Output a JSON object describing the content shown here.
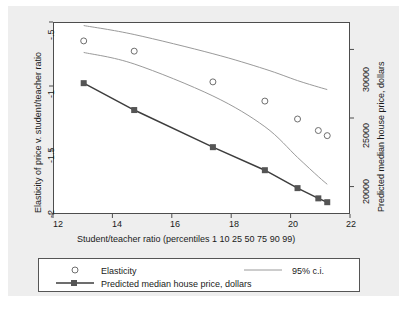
{
  "chart_data": {
    "type": "line",
    "title": "",
    "xlabel": "Student/teacher ratio (percentiles 1 10 25 50 75 90 99)",
    "ylabel": "Elasticity of price v. student/teacher ratio",
    "ylabel_right": "Predicted median house price, dollars",
    "xlim": [
      12,
      22
    ],
    "ylim": [
      -2.0,
      -0.5
    ],
    "ylim_right": [
      18000,
      32000
    ],
    "xticks": [
      "12",
      "14",
      "16",
      "18",
      "20",
      "22"
    ],
    "xtick_values": [
      12,
      14,
      16,
      18,
      20,
      22
    ],
    "yticks": [
      "-.5",
      "-1",
      "-1.5",
      "-2"
    ],
    "ytick_values": [
      -0.5,
      -1,
      -1.5,
      -2
    ],
    "yticks_right": [
      "20000",
      "25000",
      "30000"
    ],
    "ytick_right_values": [
      20000,
      25000,
      30000
    ],
    "grid": false,
    "legend_position": "bottom",
    "x": [
      13.0,
      14.7,
      17.35,
      19.1,
      20.2,
      20.9,
      21.2
    ],
    "series": [
      {
        "name": "Elasticity",
        "marker": "open-circle",
        "color": "#6e6e6e",
        "values": [
          -0.64,
          -0.72,
          -0.96,
          -1.11,
          -1.25,
          -1.34,
          -1.38
        ]
      },
      {
        "name": "95% c.i. upper",
        "marker": "none",
        "color": "#9a9a9a",
        "values": [
          -0.52,
          -0.59,
          -0.74,
          -0.86,
          -0.95,
          -1.0,
          -1.02
        ]
      },
      {
        "name": "95% c.i. lower",
        "marker": "none",
        "color": "#9a9a9a",
        "values": [
          -0.73,
          -0.82,
          -1.07,
          -1.31,
          -1.55,
          -1.7,
          -1.76
        ]
      },
      {
        "name": "Predicted median house price, dollars",
        "marker": "filled-square",
        "color": "#3d3d3d",
        "values": [
          -0.97,
          -1.18,
          -1.47,
          -1.65,
          -1.79,
          -1.87,
          -1.9
        ],
        "right_axis_values": [
          29700,
          27000,
          23700,
          21600,
          20200,
          19400,
          19100
        ]
      }
    ]
  },
  "axes": {
    "x_title": "Student/teacher ratio (percentiles 1 10 25 50 75 90 99)",
    "y_left_title": "Elasticity of price v. student/teacher ratio",
    "y_right_title": "Predicted median house price, dollars",
    "x_tick_labels": [
      "12",
      "14",
      "16",
      "18",
      "20",
      "22"
    ],
    "y_left_tick_labels": [
      "-.5",
      "-1",
      "-1.5",
      "-2"
    ],
    "y_right_tick_labels": [
      "30000",
      "25000",
      "20000"
    ]
  },
  "legend": {
    "entries": [
      {
        "label": "Elasticity",
        "marker": "open-circle"
      },
      {
        "label": "95% c.i.",
        "marker": "line"
      },
      {
        "label": "Predicted median house price, dollars",
        "marker": "line-square"
      }
    ]
  },
  "colors": {
    "plot_background": "#ffffff",
    "graph_background": "#eeeeee",
    "axis": "#4d4d4d",
    "elasticity_marker": "#6e6e6e",
    "ci_line": "#9a9a9a",
    "price_line": "#3d3d3d",
    "text": "#1a1a1a"
  }
}
